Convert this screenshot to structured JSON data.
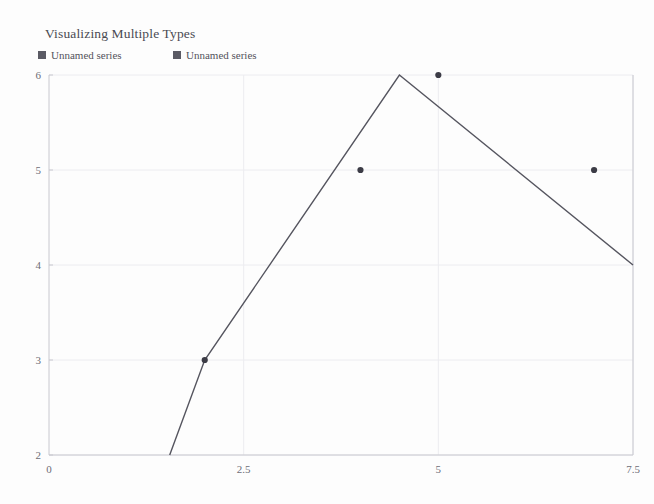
{
  "chart_data": {
    "type": "line",
    "title": "Visualizing Multiple Types",
    "xlabel": "",
    "ylabel": "",
    "xlim": [
      0,
      7.5
    ],
    "ylim": [
      2,
      6
    ],
    "xticks": [
      "0",
      "2.5",
      "5",
      "7.5"
    ],
    "xtick_values": [
      0,
      2.5,
      5,
      7.5
    ],
    "yticks": [
      "2",
      "3",
      "4",
      "5",
      "6"
    ],
    "ytick_values": [
      2,
      3,
      4,
      5,
      6
    ],
    "grid": true,
    "legend_position": "top-left",
    "series": [
      {
        "name": "Unnamed series",
        "type": "line",
        "color": "#55555f",
        "points": [
          {
            "x": 1.55,
            "y": 2
          },
          {
            "x": 2.0,
            "y": 3
          },
          {
            "x": 4.5,
            "y": 6
          },
          {
            "x": 7.5,
            "y": 4
          }
        ]
      },
      {
        "name": "Unnamed series",
        "type": "scatter",
        "color": "#3c3c46",
        "points": [
          {
            "x": 2,
            "y": 3
          },
          {
            "x": 4,
            "y": 5
          },
          {
            "x": 5,
            "y": 6
          },
          {
            "x": 7,
            "y": 5
          }
        ]
      }
    ],
    "legend": [
      {
        "label": "Unnamed series",
        "color": "#5a5a64"
      },
      {
        "label": "Unnamed series",
        "color": "#5a5a64"
      }
    ],
    "colors": {
      "background": "#fdfdfd",
      "axis": "#c8c8cf",
      "grid": "#ececf0",
      "title_text": "#4a4a52",
      "tick_text": "#6d6d76",
      "line": "#55555f",
      "marker": "#3c3c46"
    }
  }
}
